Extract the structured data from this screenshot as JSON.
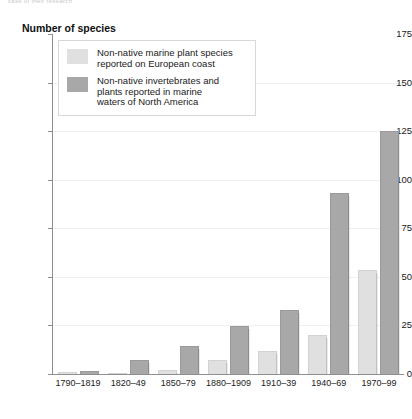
{
  "page": {
    "cut_off_header": "case of their research"
  },
  "chart_data": {
    "type": "bar",
    "title": "Number of species",
    "xlabel": "",
    "ylabel": "Number of species",
    "ylim": [
      0,
      175
    ],
    "ytick_step": 25,
    "yticks": [
      "175",
      "150",
      "125",
      "100",
      "75",
      "50",
      "25",
      "0"
    ],
    "grid": true,
    "legend_position": "top-left",
    "categories": [
      "1790–1819",
      "1820–49",
      "1850–79",
      "1880–1909",
      "1910–39",
      "1940–69",
      "1970–99"
    ],
    "series": [
      {
        "name": "Non-native marine plant species reported on European coast",
        "color": "#e0e0e0",
        "values": [
          1,
          0.5,
          2,
          7,
          12,
          20,
          53.5
        ]
      },
      {
        "name": "Non-native invertebrates and plants reported in marine waters of North America",
        "color": "#a8a8a8",
        "values": [
          1.5,
          7,
          14.5,
          24.5,
          33,
          93,
          125
        ]
      }
    ]
  },
  "legend": {
    "items": [
      {
        "swatch": "light",
        "lines": [
          "Non-native marine plant species",
          "reported on European coast"
        ]
      },
      {
        "swatch": "dark",
        "lines": [
          "Non-native invertebrates and",
          "plants reported in marine",
          "waters of North America"
        ]
      }
    ]
  }
}
